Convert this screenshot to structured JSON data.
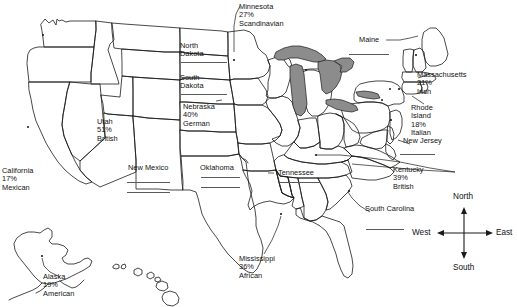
{
  "document": {
    "title": "United States Ancestry Map Worksheet",
    "type": "fill-in-the-blank map"
  },
  "map": {
    "background_color": "#ffffff",
    "outline_color": "#1a1a1a",
    "lake_fill_color": "#8c8c8c",
    "blank_line_color": "#5a5a5a"
  },
  "labels": {
    "minnesota": {
      "name": "Minnesota",
      "percent": "27%",
      "ancestry": "Scandinavian"
    },
    "north_dakota": {
      "name": "North",
      "name2": "Dakota",
      "percent": "",
      "ancestry": ""
    },
    "south_dakota": {
      "name": "South",
      "name2": "Dakota",
      "percent": "",
      "ancestry": ""
    },
    "nebraska": {
      "name": "Nebraska",
      "percent": "40%",
      "ancestry": "German"
    },
    "utah": {
      "name": "Utah",
      "percent": "51%",
      "ancestry": "British"
    },
    "california": {
      "name": "California",
      "percent": "17%",
      "ancestry": "Mexican"
    },
    "new_mexico": {
      "name": "New Mexico",
      "percent": "",
      "ancestry": ""
    },
    "oklahoma": {
      "name": "Oklahoma",
      "percent": "",
      "ancestry": ""
    },
    "alaska": {
      "name": "Alaska",
      "percent": "19%",
      "ancestry": "American"
    },
    "mississippi": {
      "name": "Mississippi",
      "percent": "36%",
      "ancestry": "African"
    },
    "tennessee": {
      "name": "Tennessee",
      "percent": "",
      "ancestry": ""
    },
    "kentucky": {
      "name": "Kentucky",
      "percent": "39%",
      "ancestry": "British"
    },
    "south_carolina": {
      "name": "South Carolina",
      "percent": "",
      "ancestry": ""
    },
    "maine": {
      "name": "Maine",
      "percent": "",
      "ancestry": ""
    },
    "massachusetts": {
      "name": "Massachusetts",
      "percent": "21%",
      "ancestry": "Irish"
    },
    "rhode_island": {
      "name": "Rhode",
      "name2": "Island",
      "percent": "18%",
      "ancestry": "Italian"
    },
    "new_jersey": {
      "name": "New Jersey",
      "percent": "",
      "ancestry": ""
    }
  },
  "compass": {
    "north": "North",
    "south": "South",
    "east": "East",
    "west": "West"
  }
}
